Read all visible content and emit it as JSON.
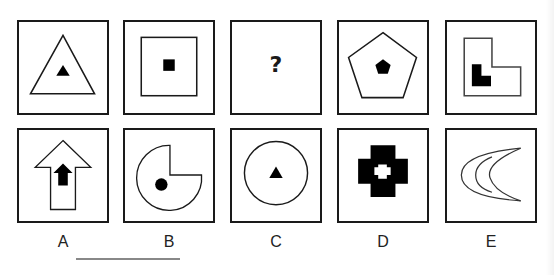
{
  "puzzle": {
    "question_mark": "?",
    "sequence": [
      {
        "id": "seq-1",
        "outer": "triangle",
        "inner": "filled-triangle"
      },
      {
        "id": "seq-2",
        "outer": "square",
        "inner": "filled-square"
      },
      {
        "id": "seq-3",
        "outer": "unknown",
        "inner": "unknown"
      },
      {
        "id": "seq-4",
        "outer": "pentagon",
        "inner": "filled-pentagon"
      },
      {
        "id": "seq-5",
        "outer": "L-shape",
        "inner": "filled-L-shape"
      }
    ],
    "options": [
      {
        "label": "A",
        "outer": "arrow-up",
        "inner": "filled-arrow-up"
      },
      {
        "label": "B",
        "outer": "pac-man-circle",
        "inner": "filled-circle"
      },
      {
        "label": "C",
        "outer": "circle",
        "inner": "filled-triangle"
      },
      {
        "label": "D",
        "outer": "filled-cross",
        "inner": "white-cross"
      },
      {
        "label": "E",
        "outer": "crescent",
        "inner": "crescent"
      }
    ]
  },
  "colors": {
    "stroke": "#1a1a1a",
    "fill": "#000000",
    "background": "#ffffff",
    "underline": "#888888"
  }
}
